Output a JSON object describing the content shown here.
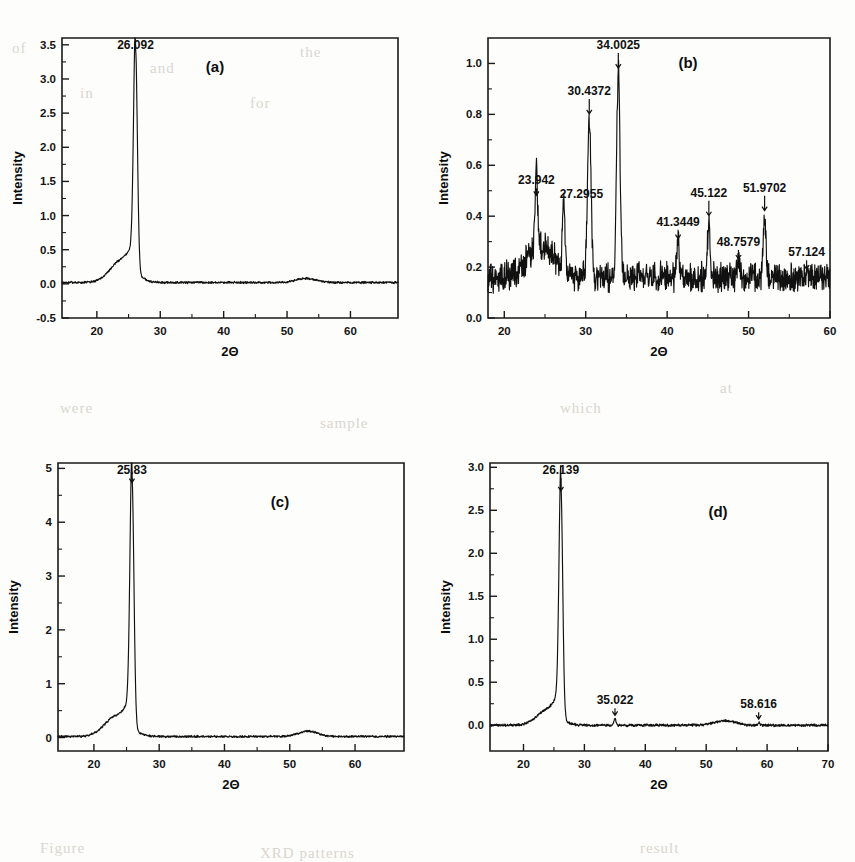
{
  "figure": {
    "background_bleed": [
      {
        "text": "of",
        "x": 12,
        "y": 40
      },
      {
        "text": "and",
        "x": 150,
        "y": 60
      },
      {
        "text": "the",
        "x": 300,
        "y": 44
      },
      {
        "text": "in",
        "x": 80,
        "y": 85
      },
      {
        "text": "for",
        "x": 250,
        "y": 95
      },
      {
        "text": "were",
        "x": 60,
        "y": 400
      },
      {
        "text": "sample",
        "x": 320,
        "y": 415
      },
      {
        "text": "which",
        "x": 560,
        "y": 400
      },
      {
        "text": "at",
        "x": 720,
        "y": 380
      },
      {
        "text": "Figure",
        "x": 40,
        "y": 840
      },
      {
        "text": "XRD patterns",
        "x": 260,
        "y": 845
      },
      {
        "text": "result",
        "x": 640,
        "y": 840
      }
    ],
    "axis_label_x": "2Θ",
    "axis_label_y": "Intensity"
  },
  "chart_data": [
    {
      "id": "a",
      "panel_label": "(a)",
      "type": "line",
      "title": "",
      "xlabel": "2Θ",
      "ylabel": "Intensity",
      "xlim": [
        14.5,
        67.5
      ],
      "ylim": [
        -0.5,
        3.6
      ],
      "xticks": [
        20,
        30,
        40,
        50,
        60
      ],
      "yticks": [
        -0.5,
        0.0,
        0.5,
        1.0,
        1.5,
        2.0,
        2.5,
        3.0,
        3.5
      ],
      "ytick_labels": [
        "-0.5",
        "0.0",
        "0.5",
        "1.0",
        "1.5",
        "2.0",
        "2.5",
        "3.0",
        "3.5"
      ],
      "minor_ticks": true,
      "grid": false,
      "peaks": [
        {
          "two_theta": 26.092,
          "label": "26.092",
          "height": 3.3
        }
      ],
      "baseline": 0.02,
      "noise": 0.012,
      "broad_humps": [
        {
          "center": 24.0,
          "width": 2.6,
          "height": 0.33
        },
        {
          "center": 53.0,
          "width": 2.2,
          "height": 0.06
        }
      ]
    },
    {
      "id": "b",
      "panel_label": "(b)",
      "type": "line",
      "title": "",
      "xlabel": "2Θ",
      "ylabel": "Intensity",
      "xlim": [
        18.0,
        60.0
      ],
      "ylim": [
        0.0,
        1.1
      ],
      "xticks": [
        20,
        30,
        40,
        50,
        60
      ],
      "yticks": [
        0.0,
        0.2,
        0.4,
        0.6,
        0.8,
        1.0
      ],
      "ytick_labels": [
        "0.0",
        "0.2",
        "0.4",
        "0.6",
        "0.8",
        "1.0"
      ],
      "minor_ticks": true,
      "grid": false,
      "peaks": [
        {
          "two_theta": 23.942,
          "label": "23.942",
          "height": 0.47
        },
        {
          "two_theta": 27.2955,
          "label": "27.2955",
          "height": 0.44
        },
        {
          "two_theta": 30.4372,
          "label": "30.4372",
          "height": 0.79
        },
        {
          "two_theta": 34.0025,
          "label": "34.0025",
          "height": 0.97
        },
        {
          "two_theta": 41.3449,
          "label": "41.3449",
          "height": 0.3
        },
        {
          "two_theta": 45.122,
          "label": "45.122",
          "height": 0.39
        },
        {
          "two_theta": 48.7579,
          "label": "48.7579",
          "height": 0.22
        },
        {
          "two_theta": 51.9702,
          "label": "51.9702",
          "height": 0.41
        },
        {
          "two_theta": 57.124,
          "label": "57.124",
          "height": 0.18
        }
      ],
      "baseline": 0.16,
      "noise": 0.045,
      "broad_humps": [
        {
          "center": 24.5,
          "width": 2.4,
          "height": 0.12
        }
      ]
    },
    {
      "id": "c",
      "panel_label": "(c)",
      "type": "line",
      "title": "",
      "xlabel": "2Θ",
      "ylabel": "Intensity",
      "xlim": [
        14.5,
        67.5
      ],
      "ylim": [
        -0.25,
        5.1
      ],
      "xticks": [
        20,
        30,
        40,
        50,
        60
      ],
      "yticks": [
        0,
        1,
        2,
        3,
        4,
        5
      ],
      "ytick_labels": [
        "0",
        "1",
        "2",
        "3",
        "4",
        "5"
      ],
      "minor_ticks": true,
      "grid": false,
      "peaks": [
        {
          "two_theta": 25.83,
          "label": "25.83",
          "height": 4.68
        }
      ],
      "baseline": 0.02,
      "noise": 0.015,
      "broad_humps": [
        {
          "center": 23.5,
          "width": 2.6,
          "height": 0.38
        },
        {
          "center": 52.8,
          "width": 2.0,
          "height": 0.1
        }
      ]
    },
    {
      "id": "d",
      "panel_label": "(d)",
      "type": "line",
      "title": "",
      "xlabel": "2Θ",
      "ylabel": "Intensity",
      "xlim": [
        14.5,
        70.0
      ],
      "ylim": [
        -0.3,
        3.05
      ],
      "xticks": [
        20,
        30,
        40,
        50,
        60,
        70
      ],
      "yticks": [
        0.0,
        0.5,
        1.0,
        1.5,
        2.0,
        2.5,
        3.0
      ],
      "ytick_labels": [
        "0.0",
        "0.5",
        "1.0",
        "1.5",
        "2.0",
        "2.5",
        "3.0"
      ],
      "minor_ticks": true,
      "grid": false,
      "peaks": [
        {
          "two_theta": 26.139,
          "label": "26.139",
          "height": 2.69
        },
        {
          "two_theta": 35.022,
          "label": "35.022",
          "height": 0.08
        },
        {
          "two_theta": 58.616,
          "label": "58.616",
          "height": 0.035
        }
      ],
      "baseline": 0.0,
      "noise": 0.012,
      "broad_humps": [
        {
          "center": 24.0,
          "width": 2.5,
          "height": 0.18
        },
        {
          "center": 53.0,
          "width": 2.4,
          "height": 0.05
        }
      ]
    }
  ]
}
